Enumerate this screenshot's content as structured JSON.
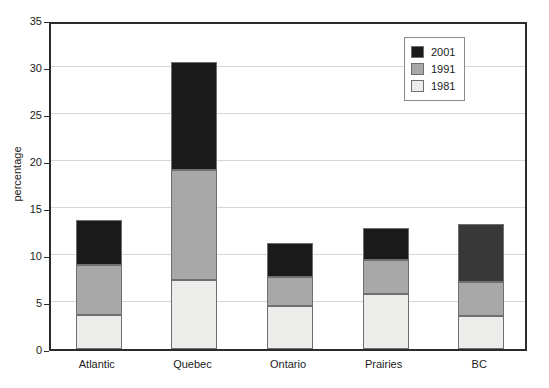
{
  "chart_data": {
    "type": "bar",
    "subtype": "stacked-vertical",
    "title": "",
    "xlabel": "",
    "ylabel": "percentage",
    "categories": [
      "Atlantic",
      "Quebec",
      "Ontario",
      "Prairies",
      "BC"
    ],
    "series": [
      {
        "name": "1981",
        "color": "#ececeb",
        "values": [
          3.6,
          7.3,
          4.6,
          5.9,
          3.5
        ]
      },
      {
        "name": "1991",
        "color": "#a8a8a8",
        "values": [
          5.3,
          11.7,
          3.1,
          3.6,
          3.6
        ]
      },
      {
        "name": "2001",
        "color": "#1a1a1a",
        "values": [
          4.8,
          11.5,
          3.6,
          3.4,
          6.2
        ]
      }
    ],
    "cumulative_tops": {
      "Atlantic": [
        3.6,
        8.9,
        13.7
      ],
      "Quebec": [
        7.3,
        19.0,
        30.5
      ],
      "Ontario": [
        4.6,
        7.7,
        11.3
      ],
      "Prairies": [
        5.9,
        9.5,
        12.9
      ],
      "BC": [
        3.5,
        7.1,
        13.3
      ]
    },
    "ylim": [
      0,
      35
    ],
    "yticks": [
      0,
      5,
      10,
      15,
      20,
      25,
      30,
      35
    ],
    "ytick_labels": [
      "0",
      "5",
      "10",
      "15",
      "20",
      "25",
      "30",
      "35"
    ],
    "grid": true,
    "grid_axis": "y",
    "legend_position": "top-right",
    "legend_entries": [
      "2001",
      "1991",
      "1981"
    ],
    "legend_colors": [
      "#1a1a1a",
      "#a8a8a8",
      "#ececeb"
    ],
    "bar_border_color": "#6f6f6f",
    "axis_color": "#2b2b2b",
    "gridline_color": "#d6d6d6"
  }
}
